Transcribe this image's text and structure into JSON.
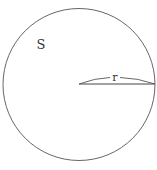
{
  "diagram": {
    "shape": "circle",
    "region_label": "S",
    "radius_label": "r",
    "stroke_color": "#555555",
    "background": "#ffffff"
  }
}
